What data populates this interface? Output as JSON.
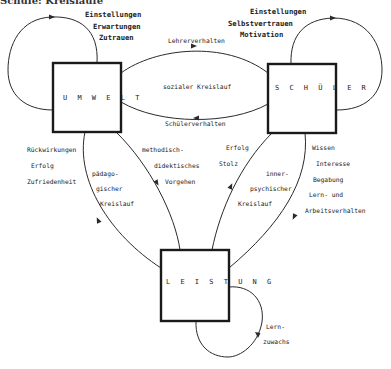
{
  "diagram": {
    "title_partial": "Schule: Kreisläufe",
    "nodes": {
      "umwelt": {
        "label": "U M W E L T"
      },
      "schueler": {
        "label": "S C H Ü L E R"
      },
      "leistung": {
        "label": "L E I S T U N G"
      }
    },
    "umwelt_loop": {
      "lines": [
        "Einstellungen",
        "Erwartungen",
        "Zutrauen"
      ]
    },
    "schueler_loop": {
      "lines": [
        "Einstellungen",
        "Selbstvertrauen",
        "Motivation"
      ]
    },
    "social_cycle": {
      "top_edge": "Lehrerverhalten",
      "center": "sozialer Kreislauf",
      "bottom_edge": "Schülerverhalten"
    },
    "pedagogic_cycle": {
      "left_labels": [
        "Rückwirkungen",
        "Erfolg",
        "Zufriedenheit"
      ],
      "center": [
        "pädago-",
        "gischer",
        "Kreislauf"
      ],
      "right_labels": [
        "methodisch-",
        "didektisches",
        "Vorgehen"
      ]
    },
    "psychic_cycle": {
      "left_labels": [
        "Erfolg",
        "Stolz"
      ],
      "center": [
        "inner-",
        "psychischer",
        "Kreislauf"
      ],
      "right_labels": [
        "Wissen",
        "Interesse",
        "Begabung",
        "Lern- und",
        "Arbeitsverhalten"
      ]
    },
    "leistung_loop": {
      "lines": [
        "Lern-",
        "zuwachs"
      ]
    }
  }
}
